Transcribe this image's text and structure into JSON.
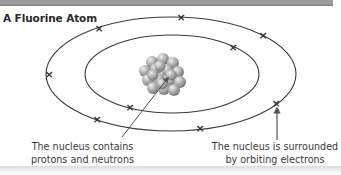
{
  "title": "A Fluorine Atom",
  "captions": {
    "nucleus": {
      "line1": "The nucleus contains",
      "line2": "protons and neutrons"
    },
    "electrons": {
      "line1": "The nucleus is surrounded",
      "line2": "by orbiting electrons"
    }
  },
  "atom": {
    "element": "Fluorine",
    "shells": [
      {
        "name": "inner",
        "electron_count": 2
      },
      {
        "name": "outer",
        "electron_count": 7
      }
    ],
    "electron_symbol": "×"
  },
  "colors": {
    "orbit": "#3a3a3a",
    "electron": "#333333",
    "nucleus_particle": "#a9a9a9",
    "rule": "#9a9a9a"
  }
}
